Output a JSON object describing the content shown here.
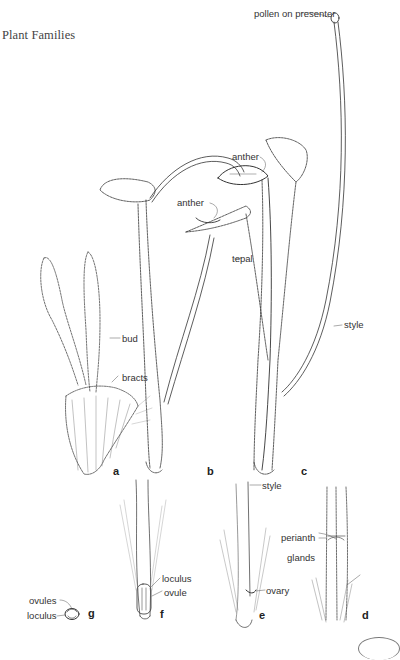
{
  "page": {
    "running_head": "Plant Families"
  },
  "figure": {
    "panels": [
      {
        "id": "a",
        "label": "a"
      },
      {
        "id": "b",
        "label": "b"
      },
      {
        "id": "c",
        "label": "c"
      },
      {
        "id": "d",
        "label": "d"
      },
      {
        "id": "e",
        "label": "e"
      },
      {
        "id": "f",
        "label": "f"
      },
      {
        "id": "g",
        "label": "g"
      }
    ],
    "annotations": {
      "pollen_on_presenter": "pollen on presenter",
      "anther_upper": "anther",
      "anther_lower": "anther",
      "tepal": "tepal",
      "style_c": "style",
      "bud": "bud",
      "bracts": "bracts",
      "style_e": "style",
      "ovary": "ovary",
      "perianth": "perianth",
      "glands": "glands",
      "loculus_f": "loculus",
      "ovule": "ovule",
      "ovules": "ovules",
      "loculus_g": "loculus"
    }
  }
}
